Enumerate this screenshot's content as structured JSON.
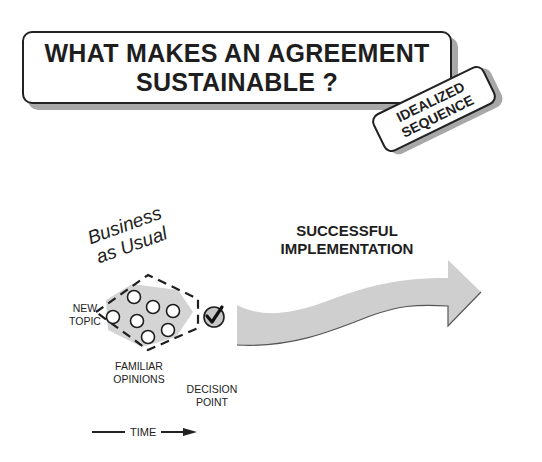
{
  "title": {
    "line1": "WHAT MAKES AN AGREEMENT",
    "line2": "SUSTAINABLE ?"
  },
  "tag": {
    "line1": "IDEALIZED",
    "line2": "SEQUENCE"
  },
  "phase_label": {
    "line1": "Business",
    "line2": "as Usual"
  },
  "labels": {
    "new_topic": {
      "line1": "NEW",
      "line2": "TOPIC"
    },
    "familiar_opinions": {
      "line1": "FAMILIAR",
      "line2": "OPINIONS"
    },
    "decision_point": {
      "line1": "DECISION",
      "line2": "POINT"
    },
    "outcome": {
      "line1": "SUCCESSFUL",
      "line2": "IMPLEMENTATION"
    },
    "time_axis": "TIME"
  },
  "colors": {
    "ink": "#1e1e1e",
    "shadow": "#a8a8a8",
    "fill_gray": "#d4d4d4",
    "arrow_gray": "#cfcfcf"
  },
  "icons": {
    "decision_point": "checkmark-circle-icon",
    "opinions": "circle-icon",
    "time_arrow": "arrow-right-icon",
    "outcome_arrow": "curved-arrow-icon"
  }
}
